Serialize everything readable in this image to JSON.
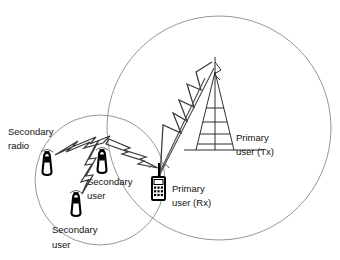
{
  "diagram": {
    "background_color": "#ffffff",
    "line_color": "#333333",
    "circle_color": "#8a8a8a",
    "labels": {
      "secondary_radio": {
        "line1": "Secondary",
        "line2": "radio"
      },
      "secondary_user_mid": {
        "line1": "Secondary",
        "line2": "user"
      },
      "secondary_user_low": {
        "line1": "Secondary",
        "line2": "user"
      },
      "primary_user_rx": {
        "line1": "Primary",
        "line2": "user (Rx)"
      },
      "primary_user_tx": {
        "line1": "Primary",
        "line2": "user (Tx)"
      }
    },
    "coverage_areas": [
      {
        "name": "primary-coverage-circle",
        "cx": 219,
        "cy": 128,
        "r": 112
      },
      {
        "name": "secondary-coverage-circle",
        "cx": 100,
        "cy": 180,
        "r": 65
      }
    ],
    "nodes": [
      {
        "name": "secondary-radio-device",
        "type": "handheld-radio",
        "x": 47,
        "y": 162
      },
      {
        "name": "secondary-user-mid-device",
        "type": "handheld-radio",
        "x": 102,
        "y": 160
      },
      {
        "name": "secondary-user-low-device",
        "type": "handheld-radio",
        "x": 76,
        "y": 203
      },
      {
        "name": "primary-user-rx-device",
        "type": "mobile-phone",
        "x": 158,
        "y": 183
      },
      {
        "name": "primary-user-tx-device",
        "type": "transmission-tower",
        "x": 215,
        "y": 95
      }
    ],
    "links": [
      {
        "name": "link-tower-to-rx",
        "from": "primary-user-tx-device",
        "to": "primary-user-rx-device",
        "style": "lightning"
      },
      {
        "name": "link-radio-to-mid",
        "from": "secondary-radio-device",
        "to": "secondary-user-mid-device",
        "style": "lightning"
      },
      {
        "name": "link-mid-to-low",
        "from": "secondary-user-mid-device",
        "to": "secondary-user-low-device",
        "style": "lightning"
      },
      {
        "name": "link-mid-to-rx",
        "from": "secondary-user-mid-device",
        "to": "primary-user-rx-device",
        "style": "lightning"
      }
    ]
  }
}
